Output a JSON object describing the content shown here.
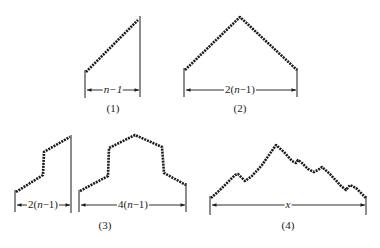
{
  "figure": {
    "panels": [
      {
        "id": "1",
        "caption": "(1)",
        "dimension_label": "n−1",
        "shape": "ramp",
        "points": [
          [
            86,
            72
          ],
          [
            138,
            20
          ]
        ],
        "verticals": [
          [
            85,
            70,
            98
          ],
          [
            140,
            16,
            97
          ]
        ],
        "dim": {
          "y": 90,
          "x1": 86,
          "x2": 140,
          "label_x": 113
        },
        "caption_pos": [
          113,
          103
        ]
      },
      {
        "id": "2",
        "caption": "(2)",
        "dimension_label": "2(n−1)",
        "shape": "triangle",
        "points": [
          [
            185,
            70
          ],
          [
            240,
            17
          ],
          [
            297,
            70
          ]
        ],
        "verticals": [
          [
            184,
            68,
            97
          ],
          [
            297,
            68,
            97
          ]
        ],
        "dim": {
          "y": 90,
          "x1": 185,
          "x2": 297,
          "label_x": 240
        },
        "caption_pos": [
          240,
          103
        ]
      },
      {
        "id": "3",
        "caption": "(3)",
        "sub_panels": [
          {
            "dimension_label": "2(n−1)",
            "points": [
              [
                16,
                192
              ],
              [
                43,
                175
              ],
              [
                44,
                152
              ],
              [
                70,
                137
              ]
            ],
            "verticals": [
              [
                15,
                190,
                212
              ],
              [
                71,
                135,
                213
              ]
            ],
            "dim": {
              "y": 205,
              "x1": 16,
              "x2": 71,
              "label_x": 43
            }
          },
          {
            "dimension_label": "4(n−1)",
            "points": [
              [
                80,
                191
              ],
              [
                108,
                176
              ],
              [
                109,
                148
              ],
              [
                135,
                135
              ],
              [
                162,
                147
              ],
              [
                164,
                173
              ],
              [
                186,
                185
              ]
            ],
            "verticals": [
              [
                79,
                190,
                212
              ],
              [
                186,
                183,
                212
              ]
            ],
            "dim": {
              "y": 205,
              "x1": 80,
              "x2": 186,
              "label_x": 133
            }
          }
        ],
        "caption_pos": [
          105,
          220
        ]
      },
      {
        "id": "4",
        "caption": "(4)",
        "dimension_label": "x",
        "shape": "random-walk",
        "points": [
          [
            211,
            198
          ],
          [
            222,
            188
          ],
          [
            235,
            175
          ],
          [
            238,
            174
          ],
          [
            241,
            177
          ],
          [
            245,
            181
          ],
          [
            252,
            176
          ],
          [
            262,
            165
          ],
          [
            276,
            145
          ],
          [
            284,
            152
          ],
          [
            292,
            161
          ],
          [
            296,
            163
          ],
          [
            298,
            160
          ],
          [
            302,
            163
          ],
          [
            308,
            169
          ],
          [
            314,
            172
          ],
          [
            318,
            170
          ],
          [
            322,
            167
          ],
          [
            330,
            174
          ],
          [
            340,
            185
          ],
          [
            346,
            190
          ],
          [
            350,
            185
          ],
          [
            356,
            188
          ],
          [
            366,
            198
          ]
        ],
        "verticals": [
          [
            210,
            196,
            215
          ],
          [
            366,
            196,
            215
          ]
        ],
        "dim": {
          "y": 205,
          "x1": 211,
          "x2": 366,
          "label_x": 288
        },
        "caption_pos": [
          288,
          220
        ]
      }
    ],
    "colors": {
      "ink": "#1a1a1a",
      "background": "#ffffff"
    }
  }
}
